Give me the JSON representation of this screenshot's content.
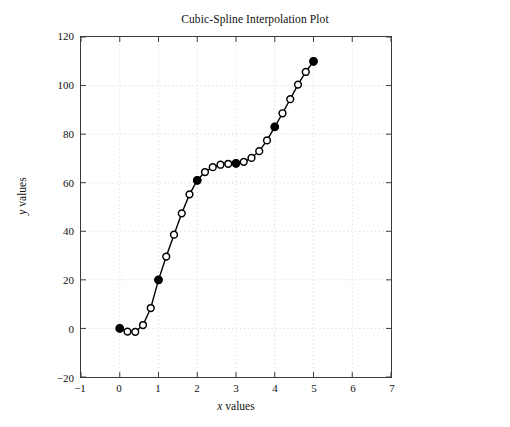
{
  "chart_data": {
    "type": "line",
    "title": "Cubic-Spline Interpolation Plot",
    "xlabel": "x values",
    "ylabel": "y values",
    "xlabel_italic_prefix": "x",
    "xlabel_rest": " values",
    "ylabel_italic_prefix": "y",
    "ylabel_rest": " values",
    "xlim": [
      -1,
      7
    ],
    "ylim": [
      -20,
      120
    ],
    "xticks": [
      -1,
      0,
      1,
      2,
      3,
      4,
      5,
      6,
      7
    ],
    "yticks": [
      -20,
      0,
      20,
      40,
      60,
      80,
      100,
      120
    ],
    "grid": true,
    "grid_style": "dotted",
    "grid_color": "#c8c8c8",
    "legend": "none",
    "line_color": "#000000",
    "marker": "circle-open",
    "marker_color": "#000000",
    "knot_marker": "circle-filled",
    "series": [
      {
        "name": "spline",
        "x": [
          0.0,
          0.2,
          0.4,
          0.6,
          0.8,
          1.0,
          1.2,
          1.4,
          1.6,
          1.8,
          2.0,
          2.2,
          2.4,
          2.6,
          2.8,
          3.0,
          3.2,
          3.4,
          3.6,
          3.8,
          4.0,
          4.2,
          4.4,
          4.6,
          4.8,
          5.0
        ],
        "y": [
          0.0,
          -1.3,
          -1.4,
          1.4,
          8.4,
          20.0,
          29.6,
          38.6,
          47.4,
          55.2,
          61.0,
          64.4,
          66.4,
          67.4,
          67.8,
          68.0,
          68.6,
          70.2,
          73.0,
          77.4,
          83.0,
          88.6,
          94.4,
          100.4,
          105.6,
          110.0
        ]
      },
      {
        "name": "data points",
        "x": [
          0,
          1,
          2,
          3,
          4,
          5
        ],
        "y": [
          0,
          20,
          61,
          68,
          83,
          110
        ]
      }
    ]
  }
}
